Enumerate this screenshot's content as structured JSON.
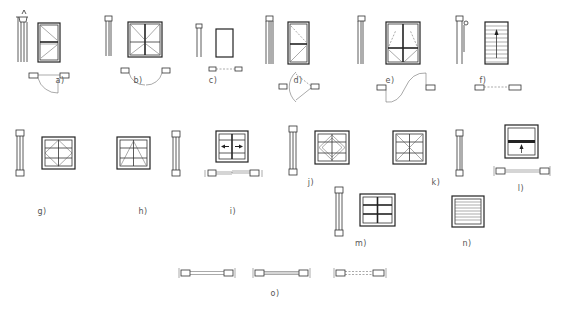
{
  "colors": {
    "line": "#222222",
    "background": "#ffffff",
    "label": "#555555"
  },
  "labels": [
    {
      "id": "a",
      "text": "a)",
      "x": 60,
      "y": 82,
      "description": "Single casement window, side-hung, with section and plan swing"
    },
    {
      "id": "b",
      "text": "b)",
      "x": 138,
      "y": 82,
      "description": "Double casement window, side-hung, opening both ways"
    },
    {
      "id": "c",
      "text": "c)",
      "x": 213,
      "y": 82,
      "description": "Fixed window"
    },
    {
      "id": "d",
      "text": "d)",
      "x": 298,
      "y": 82,
      "description": "Casement opening inward/outward with arc in plan"
    },
    {
      "id": "e",
      "text": "e)",
      "x": 390,
      "y": 82,
      "description": "Double-leaf casement with S-curve swing in plan"
    },
    {
      "id": "f",
      "text": "f)",
      "x": 483,
      "y": 82,
      "description": "Roller shutter / louvre window with upward arrow"
    },
    {
      "id": "g",
      "text": "g)",
      "x": 42,
      "y": 208,
      "description": "Pivot window (horizontal and vertical)"
    },
    {
      "id": "h",
      "text": "h)",
      "x": 143,
      "y": 208,
      "description": "Bottom-hung window"
    },
    {
      "id": "i",
      "text": "i)",
      "x": 233,
      "y": 208,
      "description": "Horizontal sliding window"
    },
    {
      "id": "j",
      "text": "j)",
      "x": 311,
      "y": 183,
      "description": "Pivot window with diamond pattern"
    },
    {
      "id": "k",
      "text": "k)",
      "x": 434,
      "y": 183,
      "description": "Vertical pivot window with diagonals"
    },
    {
      "id": "l",
      "text": "l)",
      "x": 520,
      "y": 188,
      "description": "Vertical sliding (sash) window"
    },
    {
      "id": "m",
      "text": "m)",
      "x": 361,
      "y": 244,
      "description": "Fixed multi-pane window"
    },
    {
      "id": "n",
      "text": "n)",
      "x": 467,
      "y": 244,
      "description": "Louvre window"
    },
    {
      "id": "o",
      "text": "o)",
      "x": 275,
      "y": 294,
      "description": "Plan symbols of window openings"
    }
  ]
}
